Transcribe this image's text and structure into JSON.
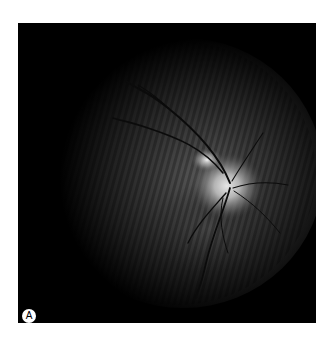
{
  "figure": {
    "panel_label": "A",
    "image_subject": "retinal-fundus-photograph",
    "colors": {
      "background": "#000000",
      "page": "#ffffff",
      "label_circle": "#ffffff",
      "label_text": "#000000"
    }
  }
}
